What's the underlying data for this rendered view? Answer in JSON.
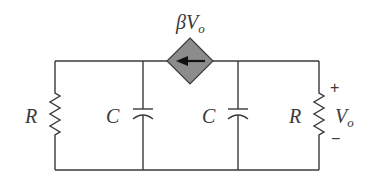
{
  "diagram": {
    "type": "circuit",
    "source": {
      "kind": "dependent-current-source",
      "label": "βV",
      "label_sub": "o",
      "direction": "left"
    },
    "components": [
      {
        "id": "R1",
        "kind": "resistor",
        "label": "R"
      },
      {
        "id": "C1",
        "kind": "capacitor",
        "label": "C"
      },
      {
        "id": "C2",
        "kind": "capacitor",
        "label": "C"
      },
      {
        "id": "R2",
        "kind": "resistor",
        "label": "R"
      }
    ],
    "output": {
      "label": "V",
      "label_sub": "o",
      "plus": "+",
      "minus": "−"
    },
    "colors": {
      "wire": "#3a3a3a",
      "source_fill": "#8c8c8c",
      "arrow": "#111111"
    }
  }
}
